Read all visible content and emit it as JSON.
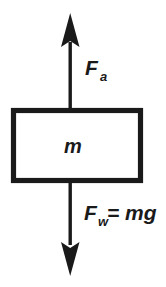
{
  "diagram": {
    "colors": {
      "ink": "#1a1a1a",
      "background": "#ffffff"
    },
    "body": {
      "mass_label": "m",
      "shape": "rectangle"
    },
    "forces": [
      {
        "id": "applied",
        "direction": "up",
        "symbol": "F",
        "subscript": "a",
        "label": "F",
        "expression": ""
      },
      {
        "id": "weight",
        "direction": "down",
        "symbol": "F",
        "subscript": "w",
        "label": "F",
        "expression": " = mg"
      }
    ],
    "labels": {
      "applied_symbol": "F",
      "applied_subscript": "a",
      "weight_symbol": "F",
      "weight_subscript": "w",
      "weight_expression": "= mg",
      "mass": "m"
    }
  }
}
